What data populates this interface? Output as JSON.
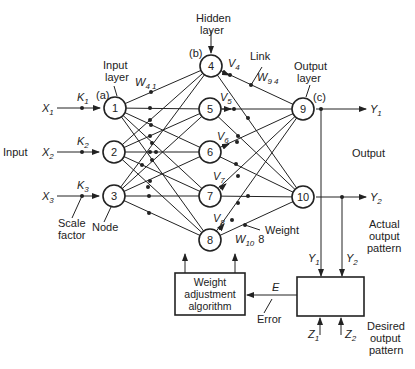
{
  "diagram": {
    "input_label": "Input",
    "output_label": "Output",
    "inputs": [
      {
        "id": "X1",
        "var": "X",
        "sub": "1",
        "scale": "K",
        "scale_sub": "1"
      },
      {
        "id": "X2",
        "var": "X",
        "sub": "2",
        "scale": "K",
        "scale_sub": "2"
      },
      {
        "id": "X3",
        "var": "X",
        "sub": "3",
        "scale": "K",
        "scale_sub": "3"
      }
    ],
    "layers": {
      "input": {
        "label_line1": "Input",
        "label_line2": "layer",
        "tag": "(a)",
        "nodes": [
          "1",
          "2",
          "3"
        ]
      },
      "hidden": {
        "label_line1": "Hidden",
        "label_line2": "layer",
        "tag": "(b)",
        "nodes": [
          "4",
          "5",
          "6",
          "7",
          "8"
        ]
      },
      "output": {
        "label_line1": "Output",
        "label_line2": "layer",
        "tag": "(c)",
        "nodes": [
          "9",
          "10"
        ]
      }
    },
    "hidden_outputs": [
      {
        "var": "V",
        "sub": "4"
      },
      {
        "var": "V",
        "sub": "5"
      },
      {
        "var": "V",
        "sub": "6"
      },
      {
        "var": "V",
        "sub": "7"
      },
      {
        "var": "V",
        "sub": "8"
      }
    ],
    "weights": {
      "w41": {
        "var": "W",
        "sub": "4 1"
      },
      "w94": {
        "var": "W",
        "sub": "9 4"
      },
      "w108": {
        "var": "W",
        "sub": "10",
        "suffix": "8"
      }
    },
    "outputs": [
      {
        "var": "Y",
        "sub": "1"
      },
      {
        "var": "Y",
        "sub": "2"
      }
    ],
    "annotations": {
      "link": "Link",
      "weight": "Weight",
      "node": "Node",
      "scale_factor_line1": "Scale",
      "scale_factor_line2": "factor",
      "actual_line1": "Actual",
      "actual_line2": "output",
      "actual_line3": "pattern",
      "desired_line1": "Desired",
      "desired_line2": "output",
      "desired_line3": "pattern",
      "error": "Error",
      "error_var": "E"
    },
    "weight_box": {
      "line1": "Weight",
      "line2": "adjustment",
      "line3": "algorithm"
    },
    "comparator_inputs": [
      {
        "var": "Y",
        "sub": "1"
      },
      {
        "var": "Y",
        "sub": "2"
      }
    ],
    "desired_inputs": [
      {
        "var": "Z",
        "sub": "1"
      },
      {
        "var": "Z",
        "sub": "2"
      }
    ],
    "colors": {
      "ink": "#222222",
      "background": "#ffffff"
    }
  }
}
